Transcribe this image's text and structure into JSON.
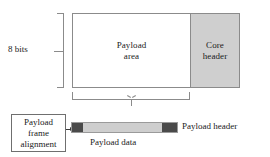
{
  "diagram": {
    "main_box": {
      "payload_area_label_line1": "Payload",
      "payload_area_label_line2": "area",
      "core_header_label_line1": "Core",
      "core_header_label_line2": "header",
      "core_header_fill": "#cfcfcf",
      "payload_area_fill": "#ffffff",
      "border_color": "#8b8b8b"
    },
    "bits_bracket": {
      "label": "8 bits"
    },
    "alignment_box": {
      "line1": "Payload",
      "line2": "frame",
      "line3": "alignment"
    },
    "frame_bar": {
      "header_left_fill": "#4a4a4a",
      "data_fill": "#cecece",
      "header_right_fill": "#4a4a4a",
      "data_label": "Payload data",
      "header_label": "Payload header"
    }
  }
}
